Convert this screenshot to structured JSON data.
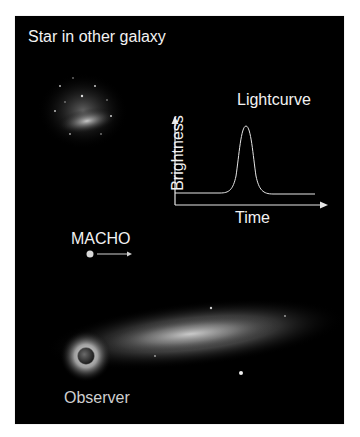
{
  "diagram": {
    "labels": {
      "source": "Star in other galaxy",
      "lens": "MACHO",
      "observer": "Observer"
    },
    "lightcurve": {
      "title": "Lightcurve",
      "xlabel": "Time",
      "ylabel": "Brightness"
    },
    "colors": {
      "background": "#000000",
      "text": "#f2f2f2",
      "curve": "#e6e6e6",
      "frame": "#ffffff"
    }
  }
}
